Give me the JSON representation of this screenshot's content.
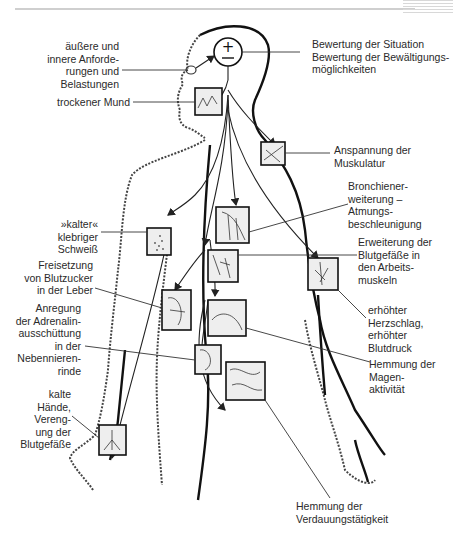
{
  "diagram": {
    "type": "stress-response body illustration",
    "center_symbol": "±",
    "labels_left": [
      {
        "id": "demands",
        "text": "äußere und\ninnere Anforde-\nrungen und\nBelastungen"
      },
      {
        "id": "dry-mouth",
        "text": "trockener Mund"
      },
      {
        "id": "cold-sweat",
        "text": "»kalter«\nklebriger\nSchweiß"
      },
      {
        "id": "blood-sugar",
        "text": "Freisetzung\nvon Blutzucker\nin der Leber"
      },
      {
        "id": "adrenaline",
        "text": "Anregung\nder Adrenalin-\nausschüttung\nin der\nNebennieren-\nrinde"
      },
      {
        "id": "cold-hands",
        "text": "kalte\nHände,\nVereng-\nung der\nBlutgefäße"
      }
    ],
    "labels_right": [
      {
        "id": "appraisal",
        "text": "Bewertung der Situation\nBewertung der Bewältigungs-\nmöglichkeiten"
      },
      {
        "id": "muscle-tension",
        "text": "Anspannung der\nMuskulatur"
      },
      {
        "id": "bronchial",
        "text": "Bronchiener-\nweiterung –\nAtmungs-\nbeschleunigung"
      },
      {
        "id": "vessel-dilation",
        "text": "Erweiterung der\nBlutgefäße in\nden Arbeits-\nmuskeln"
      },
      {
        "id": "heart-rate",
        "text": "erhöhter\nHerzschlag,\nerhöhter\nBlutdruck"
      },
      {
        "id": "stomach",
        "text": "Hemmung der\nMagen-\naktivität"
      },
      {
        "id": "digestion",
        "text": "Hemmung der\nVerdauungstätigkeit"
      }
    ]
  }
}
